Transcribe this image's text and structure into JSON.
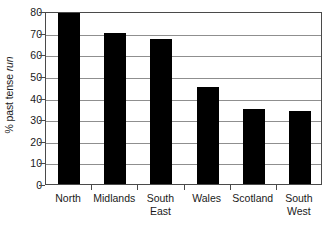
{
  "chart_data": {
    "type": "bar",
    "title": "",
    "subtitle": "",
    "xlabel": "",
    "ylabel": "% past tense run",
    "ylabel_plain": "% past tense ",
    "ylabel_italic": "run",
    "categories": [
      "North",
      "Midlands",
      "South East",
      "Wales",
      "Scotland",
      "South West"
    ],
    "category_lines": [
      [
        "North"
      ],
      [
        "Midlands"
      ],
      [
        "South",
        "East"
      ],
      [
        "Wales"
      ],
      [
        "Scotland"
      ],
      [
        "South",
        "West"
      ]
    ],
    "values": [
      79,
      70,
      67,
      45,
      34.5,
      34
    ],
    "ylim": [
      0,
      80
    ],
    "yticks": [
      80,
      70,
      60,
      50,
      40,
      30,
      20,
      10,
      0
    ],
    "ytick_labels": [
      "80",
      "70",
      "60",
      "50",
      "40",
      "30",
      "20",
      "10",
      "0"
    ],
    "grid": true,
    "grid_axis": "y",
    "legend": false,
    "legend_position": "none",
    "bar_color": "#000000",
    "grid_color": "#8f8f8f",
    "axis_color": "#4a4a4a",
    "background_color": "#ffffff",
    "text_color": "#1a1a1a"
  }
}
